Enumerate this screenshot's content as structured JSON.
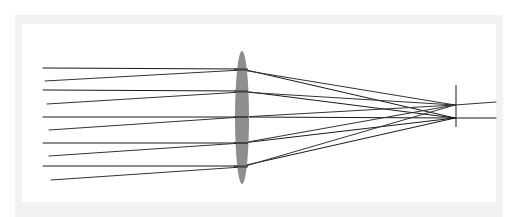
{
  "diagram": {
    "title": "",
    "type": "converging-lens-ray-diagram",
    "colors": {
      "frame": "#f2f2f2",
      "background": "#ffffff",
      "lens": "#8e8e8e",
      "ray": "#1a1a1a",
      "ray_angled": "#333333",
      "focal_plane": "#1a1a1a"
    },
    "frame": {
      "outer": {
        "x": 15,
        "y": 15,
        "w": 488,
        "h": 202
      },
      "inner": {
        "x": 22,
        "y": 24,
        "w": 474,
        "h": 178
      }
    },
    "lens": {
      "cx": 242,
      "cy": 117.5,
      "rx": 7,
      "ry": 66.5
    },
    "focal_plane": {
      "x": 456,
      "y1": 85,
      "y2": 127
    },
    "foci": {
      "on_axis": {
        "x": 455,
        "y": 118
      },
      "off_axis": {
        "x": 455,
        "y": 105
      }
    },
    "parallel_rays": [
      {
        "start": [
          43,
          68
        ],
        "lens": [
          242,
          69
        ],
        "focus": [
          455,
          118
        ]
      },
      {
        "start": [
          43,
          90
        ],
        "lens": [
          242,
          91
        ],
        "focus": [
          455,
          118
        ]
      },
      {
        "start": [
          43,
          117
        ],
        "lens": [
          242,
          117
        ],
        "focus": [
          455,
          118
        ],
        "exit": [
          496,
          118
        ]
      },
      {
        "start": [
          43,
          143
        ],
        "lens": [
          242,
          143
        ],
        "focus": [
          455,
          118
        ]
      },
      {
        "start": [
          43,
          166
        ],
        "lens": [
          242,
          166
        ],
        "focus": [
          455,
          118
        ]
      }
    ],
    "angled_rays": [
      {
        "start": [
          45,
          81
        ],
        "lens": [
          242,
          70
        ],
        "focus": [
          455,
          105
        ]
      },
      {
        "start": [
          47,
          104
        ],
        "lens": [
          242,
          92
        ],
        "focus": [
          455,
          105
        ]
      },
      {
        "start": [
          49,
          130
        ],
        "lens": [
          242,
          117
        ],
        "focus": [
          455,
          105
        ],
        "exit": [
          496,
          102
        ]
      },
      {
        "start": [
          49,
          156
        ],
        "lens": [
          242,
          143
        ],
        "focus": [
          455,
          105
        ]
      },
      {
        "start": [
          51,
          180
        ],
        "lens": [
          242,
          167
        ],
        "focus": [
          455,
          105
        ]
      }
    ]
  }
}
